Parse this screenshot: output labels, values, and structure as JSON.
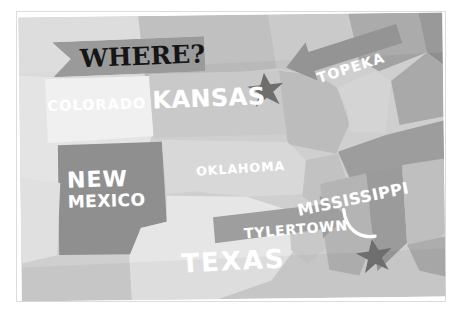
{
  "poster": {
    "title": "WHERE?",
    "type": "stylized-grayscale-us-map"
  },
  "banner": {
    "label": "WHERE?",
    "shape": "ribbon-notched-left",
    "fill": "#9a9a9a",
    "text_color": "#151515"
  },
  "states": [
    {
      "name": "COLORADO",
      "fill": "#f0f0f0",
      "label_color": "#ffffff"
    },
    {
      "name": "KANSAS",
      "fill": "#c9c9c9",
      "label_color": "#ffffff"
    },
    {
      "name": "NEW MEXICO",
      "line1": "NEW",
      "line2": "MEXICO",
      "fill": "#8f8f8f",
      "label_color": "#ffffff"
    },
    {
      "name": "OKLAHOMA",
      "fill": "#d8d8d8",
      "label_color": "#ffffff"
    },
    {
      "name": "TEXAS",
      "fill": "#e6e6e6",
      "label_color": "#ffffff"
    },
    {
      "name": "MISSISSIPPI",
      "fill": "#b4b4b4",
      "label_color": "#ffffff"
    }
  ],
  "markers": [
    {
      "name": "topeka-star",
      "city": "TOPEKA",
      "fill": "#6e6e6e"
    },
    {
      "name": "tylertown-star",
      "city": "TYLERTOWN",
      "fill": "#6e6e6e"
    }
  ],
  "callouts": [
    {
      "label": "TOPEKA",
      "shape": "arrow-pointing-left",
      "fill": "#949494",
      "text_color": "#ffffff"
    },
    {
      "label": "TYLERTOWN",
      "shape": "arrow-pointing-right",
      "fill": "#9e9e9e",
      "text_color": "#ffffff"
    }
  ],
  "decorations": [
    {
      "name": "mississippi-underline-swoosh",
      "color": "#ffffff"
    }
  ],
  "colors": {
    "page_background": "#ffffff",
    "frame_border": "#dcdcdc",
    "map_background": "#cfcfcf",
    "label_white": "#ffffff",
    "banner_gray": "#9a9a9a",
    "star_gray": "#6e6e6e"
  }
}
